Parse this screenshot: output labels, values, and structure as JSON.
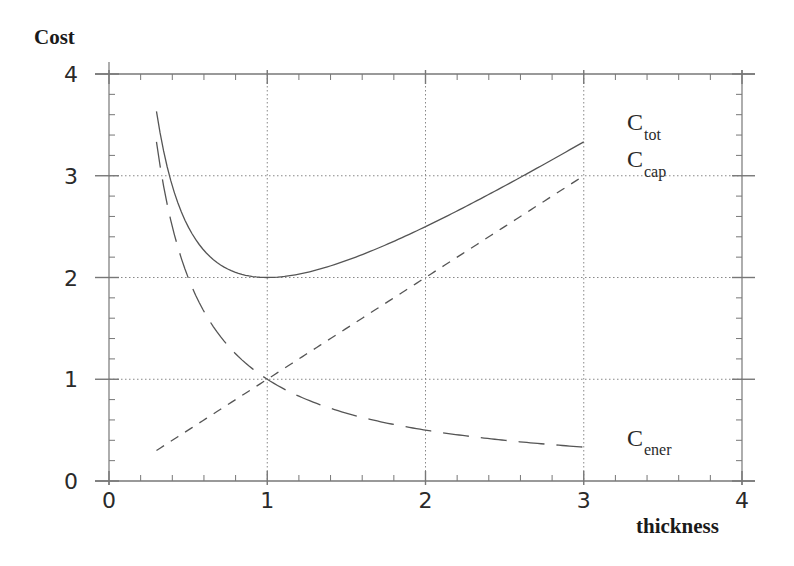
{
  "chart_data": {
    "type": "line",
    "title": "",
    "xlabel": "thickness",
    "ylabel": "Cost",
    "xlim": [
      0,
      4
    ],
    "ylim": [
      0,
      4
    ],
    "xticks": [
      0,
      1,
      2,
      3,
      4
    ],
    "yticks": [
      0,
      1,
      2,
      3,
      4
    ],
    "xtick_labels": [
      "0",
      "1",
      "2",
      "3",
      "4"
    ],
    "ytick_labels": [
      "0",
      "1",
      "2",
      "3",
      "4"
    ],
    "minor_ticks_per_major": 5,
    "grid": "dotted at major ticks",
    "legend": "inline labels at right",
    "x": [
      0.3,
      0.4,
      0.5,
      0.6,
      0.7,
      0.8,
      0.9,
      1.0,
      1.25,
      1.5,
      1.75,
      2.0,
      2.25,
      2.5,
      2.75,
      3.0
    ],
    "series": [
      {
        "name": "C_tot",
        "label_main": "C",
        "label_sub": "tot",
        "style": "solid",
        "formula": "x + 1/x",
        "values": [
          3.63,
          2.9,
          2.5,
          2.27,
          2.13,
          2.05,
          2.01,
          2.0,
          2.05,
          2.17,
          2.32,
          2.5,
          2.69,
          2.9,
          3.11,
          3.33
        ]
      },
      {
        "name": "C_cap",
        "label_main": "C",
        "label_sub": "cap",
        "style": "short-dash",
        "formula": "x",
        "values": [
          0.3,
          0.4,
          0.5,
          0.6,
          0.7,
          0.8,
          0.9,
          1.0,
          1.25,
          1.5,
          1.75,
          2.0,
          2.25,
          2.5,
          2.75,
          3.0
        ]
      },
      {
        "name": "C_ener",
        "label_main": "C",
        "label_sub": "ener",
        "style": "long-dash",
        "formula": "1/x",
        "values": [
          3.33,
          2.5,
          2.0,
          1.67,
          1.43,
          1.25,
          1.11,
          1.0,
          0.8,
          0.67,
          0.57,
          0.5,
          0.44,
          0.4,
          0.36,
          0.33
        ]
      }
    ]
  },
  "colors": {
    "axis": "#777777",
    "grid": "#888888",
    "curve": "#555555",
    "text": "#2a2a2a"
  }
}
